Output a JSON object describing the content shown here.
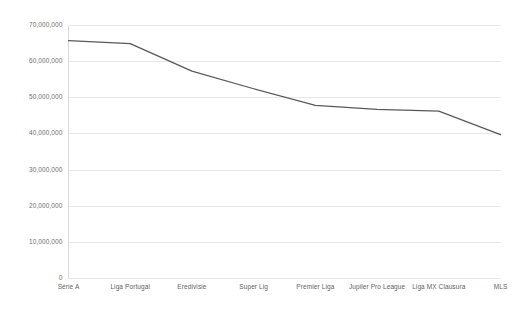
{
  "chart_data": {
    "type": "line",
    "title": "",
    "subtitle": "",
    "xlabel": "",
    "ylabel": "",
    "categories": [
      "Série A",
      "Liga Portugal",
      "Eredivisie",
      "Super Lig",
      "Premier Liga",
      "Jupiler Pro League",
      "Liga MX Clausura",
      "MLS"
    ],
    "values": [
      65800000,
      65000000,
      57400000,
      52500000,
      47900000,
      46800000,
      46300000,
      39800000
    ],
    "series": [
      {
        "name": "",
        "values": [
          65800000,
          65000000,
          57400000,
          52500000,
          47900000,
          46800000,
          46300000,
          39800000
        ]
      }
    ],
    "ylim": [
      0,
      70000000
    ],
    "yticks": [
      0,
      10000000,
      20000000,
      30000000,
      40000000,
      50000000,
      60000000,
      70000000
    ],
    "ytick_labels": [
      "0",
      "10,000,000",
      "20,000,000",
      "30,000,000",
      "40,000,000",
      "50,000,000",
      "60,000,000",
      "70,000,000"
    ],
    "grid": true,
    "grid_axis": "y",
    "legend": false,
    "legend_position": "none",
    "line_color": "#595959",
    "grid_color": "#e8e8e8",
    "axis_color": "#d9d9d9",
    "tick_label_color": "#6e6e6e",
    "background_color": "#ffffff",
    "markers": false,
    "line_width": 1.3
  }
}
